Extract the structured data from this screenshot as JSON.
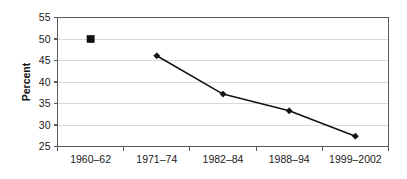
{
  "chart_data": {
    "type": "line",
    "title": "",
    "subtitle": "",
    "xlabel": "",
    "ylabel": "Percent",
    "categories": [
      "1960–62",
      "1971–74",
      "1982–84",
      "1988–94",
      "1999–2002"
    ],
    "ylim": [
      25,
      55
    ],
    "ytick_labels": [
      "25",
      "30",
      "35",
      "40",
      "45",
      "50",
      "55"
    ],
    "ytick_values": [
      25,
      30,
      35,
      40,
      45,
      50,
      55
    ],
    "grid": true,
    "legend": "none",
    "series": [
      {
        "name": "1960–62 single point",
        "marker": "square",
        "connected": false,
        "points": [
          {
            "category": "1960–62",
            "value": 50.0
          }
        ]
      },
      {
        "name": "Trend 1971–2002",
        "marker": "diamond",
        "connected": true,
        "points": [
          {
            "category": "1971–74",
            "value": 46.1
          },
          {
            "category": "1982–84",
            "value": 37.2
          },
          {
            "category": "1988–94",
            "value": 33.3
          },
          {
            "category": "1999–2002",
            "value": 27.4
          }
        ]
      }
    ],
    "colors": {
      "line": "#111111",
      "marker": "#111111",
      "gridline": "#d9d9d9",
      "frame": "#595959",
      "text": "#1a1a1a",
      "background": "#ffffff"
    }
  }
}
